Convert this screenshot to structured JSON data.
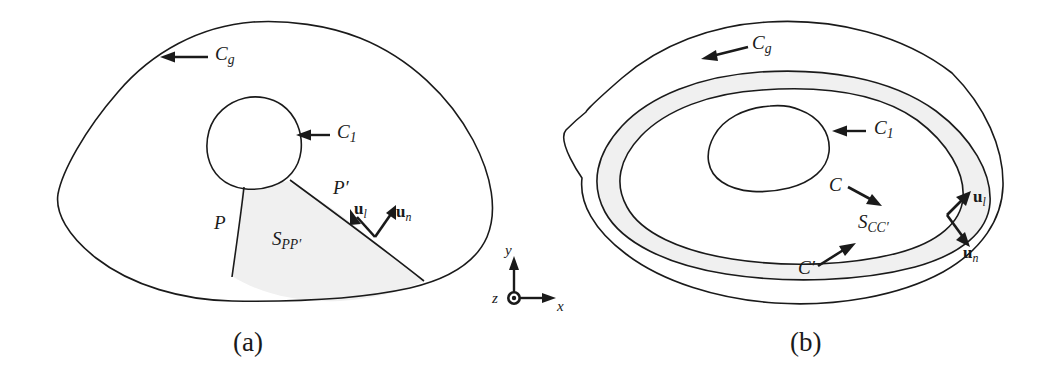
{
  "figure": {
    "domain": "scientific-diagram",
    "background_color": "#ffffff",
    "line_color": "#1a1a1a",
    "shade_color": "#f0f0f0",
    "panels": [
      {
        "id": "a",
        "caption": "(a)",
        "labels": {
          "outer_contour": {
            "base": "C",
            "sub": "g"
          },
          "inner_contour": {
            "base": "C",
            "sub": "1"
          },
          "cut_start": "P",
          "cut_end": "P′",
          "surface": {
            "base": "S",
            "sub": "PP′"
          },
          "vector_tangent": {
            "base": "u",
            "sub": "l"
          },
          "vector_normal": {
            "base": "u",
            "sub": "n"
          }
        }
      },
      {
        "id": "b",
        "caption": "(b)",
        "labels": {
          "outer_contour": {
            "base": "C",
            "sub": "g"
          },
          "inner_contour": {
            "base": "C",
            "sub": "1"
          },
          "band_inner": "C",
          "band_outer": "C′",
          "surface": {
            "base": "S",
            "sub": "CC′"
          },
          "vector_tangent": {
            "base": "u",
            "sub": "l"
          },
          "vector_normal": {
            "base": "u",
            "sub": "n"
          }
        }
      }
    ],
    "axes": {
      "x_label": "x",
      "y_label": "y",
      "z_label": "z",
      "z_symbol": "out-of-page-dot"
    }
  }
}
